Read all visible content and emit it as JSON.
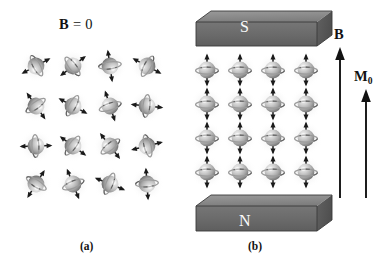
{
  "figure": {
    "background_color": "#ffffff",
    "width": 381,
    "height": 275,
    "ink_color": "#121212"
  },
  "panel_a": {
    "caption": "(a)",
    "field_label_prefix": "B",
    "field_label_equals": " = 0",
    "field_label_full": "B = 0",
    "description_name": "randomly-oriented-magnetic-dipoles",
    "grid": {
      "rows": 4,
      "cols": 4
    },
    "spins": [
      {
        "row": 0,
        "col": 0,
        "angle_deg": -118
      },
      {
        "row": 0,
        "col": 1,
        "angle_deg": 52
      },
      {
        "row": 0,
        "col": 2,
        "angle_deg": 172
      },
      {
        "row": 0,
        "col": 3,
        "angle_deg": -62
      },
      {
        "row": 1,
        "col": 0,
        "angle_deg": 145
      },
      {
        "row": 1,
        "col": 1,
        "angle_deg": 118
      },
      {
        "row": 1,
        "col": 2,
        "angle_deg": -18
      },
      {
        "row": 1,
        "col": 3,
        "angle_deg": 96
      },
      {
        "row": 2,
        "col": 0,
        "angle_deg": 88
      },
      {
        "row": 2,
        "col": 1,
        "angle_deg": 126
      },
      {
        "row": 2,
        "col": 2,
        "angle_deg": -38
      },
      {
        "row": 2,
        "col": 3,
        "angle_deg": -104
      },
      {
        "row": 3,
        "col": 0,
        "angle_deg": -148
      },
      {
        "row": 3,
        "col": 1,
        "angle_deg": -22
      },
      {
        "row": 3,
        "col": 2,
        "angle_deg": 112
      },
      {
        "row": 3,
        "col": 3,
        "angle_deg": 176
      }
    ]
  },
  "panel_b": {
    "caption": "(b)",
    "description_name": "aligned-magnetic-dipoles-between-poles",
    "grid": {
      "rows": 4,
      "cols": 4
    },
    "spin_angle_deg": 0,
    "magnets": {
      "top": {
        "pole_label": "S",
        "name": "south-pole-magnet-block",
        "face_color": "#6d6d6d",
        "top_color": "#8d8d8d",
        "side_color": "#5a5a5a"
      },
      "bottom": {
        "pole_label": "N",
        "name": "north-pole-magnet-block",
        "face_color": "#6d6d6d",
        "top_color": "#8d8d8d",
        "side_color": "#5a5a5a"
      }
    },
    "arrows": [
      {
        "label": "B",
        "subscript": "",
        "name": "field-vector-arrow"
      },
      {
        "label": "M",
        "subscript": "0",
        "name": "magnetization-vector-arrow"
      }
    ],
    "field_label": "B",
    "magnetization_label": "M",
    "magnetization_subscript": "0"
  }
}
